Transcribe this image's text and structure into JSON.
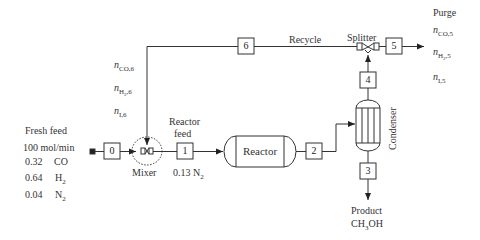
{
  "fresh_feed": {
    "title": "Fresh feed",
    "rate": "100 mol/min",
    "components": [
      {
        "fraction": "0.32",
        "species": "CO",
        "sub": ""
      },
      {
        "fraction": "0.64",
        "species": "H",
        "sub": "2"
      },
      {
        "fraction": "0.04",
        "species": "N",
        "sub": "2"
      }
    ]
  },
  "streams": {
    "s0": "0",
    "s1": "1",
    "s2": "2",
    "s3": "3",
    "s4": "4",
    "s5": "5",
    "s6": "6"
  },
  "units": {
    "mixer": "Mixer",
    "reactor": "Reactor",
    "condenser": "Condenser",
    "splitter": "Splitter"
  },
  "labels": {
    "recycle": "Recycle",
    "reactor_feed_1": "Reactor",
    "reactor_feed_2": "feed",
    "reactor_feed_n2_frac": "0.13 N",
    "reactor_feed_n2_sub": "2",
    "purge": "Purge",
    "product": "Product",
    "product_formula_a": "CH",
    "product_formula_sub": "3",
    "product_formula_b": "OH"
  },
  "recycle_vars": [
    {
      "n": "n",
      "sub": "CO,6"
    },
    {
      "n": "n",
      "sub": "H",
      "sub2": "2",
      "sub3": ",6"
    },
    {
      "n": "n",
      "sub": "I,6"
    }
  ],
  "purge_vars": [
    {
      "n": "n",
      "sub": "CO,5"
    },
    {
      "n": "n",
      "sub": "H",
      "sub2": "2",
      "sub3": ",5"
    },
    {
      "n": "n",
      "sub": "I,5"
    }
  ]
}
